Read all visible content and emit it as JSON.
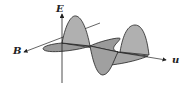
{
  "diagram": {
    "labels": {
      "electric_field": "E",
      "magnetic_field": "B",
      "propagation": "u"
    },
    "colors": {
      "wave_fill": "#a8a8a8",
      "wave_fill_dark": "#8a8a8a",
      "stroke": "#222222",
      "background": "#ffffff"
    }
  }
}
